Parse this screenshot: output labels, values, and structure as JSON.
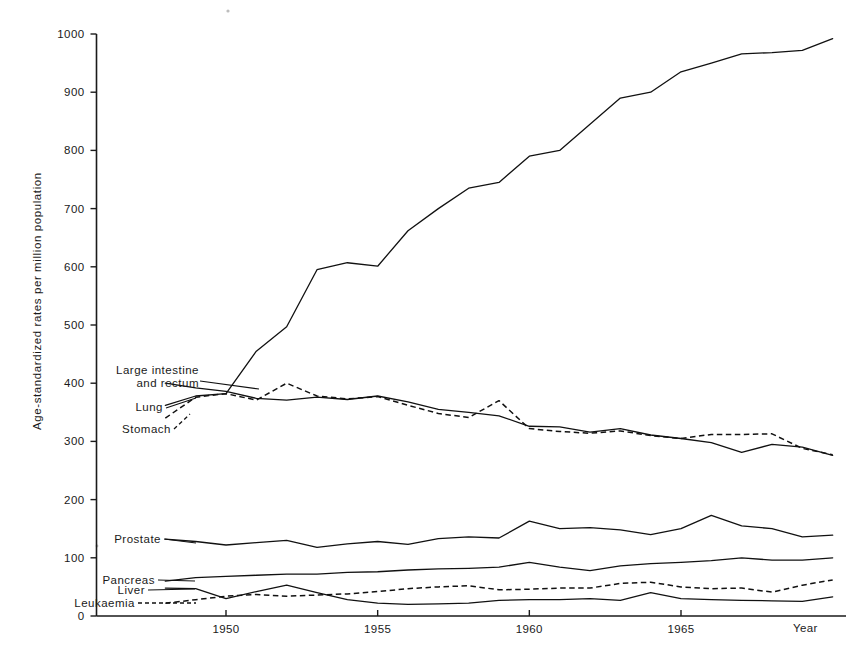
{
  "chart_data": {
    "type": "line",
    "title": "",
    "subtitle": "",
    "xlabel": "Year",
    "ylabel": "Age-standardized rates per million population",
    "xlim": [
      1947,
      1970.5
    ],
    "ylim": [
      0,
      1000
    ],
    "grid": false,
    "legend_position": "inline-left-labels",
    "y_ticks": [
      0,
      100,
      200,
      300,
      400,
      500,
      600,
      700,
      800,
      900,
      1000
    ],
    "y_tick_labels": [
      "0",
      "100",
      "200",
      "300",
      "400",
      "500",
      "600",
      "700",
      "800",
      "900",
      "1000"
    ],
    "x_ticks": [
      1950,
      1955,
      1960,
      1965
    ],
    "x_tick_labels": [
      "1950",
      "1955",
      "1960",
      "1965"
    ],
    "x": [
      1948,
      1949,
      1950,
      1951,
      1952,
      1953,
      1954,
      1955,
      1956,
      1957,
      1958,
      1959,
      1960,
      1961,
      1962,
      1963,
      1964,
      1965,
      1966,
      1967,
      1968,
      1969,
      1970
    ],
    "series": [
      {
        "name": "Lung",
        "style": "solid",
        "label": "Lung",
        "values": [
          362,
          378,
          382,
          455,
          497,
          595,
          607,
          601,
          662,
          700,
          735,
          745,
          790,
          800,
          845,
          890,
          900,
          935,
          950,
          966,
          968,
          972,
          992
        ]
      },
      {
        "name": "Large intestine and rectum",
        "style": "solid",
        "label": "Large  intestine\nand  rectum",
        "values": [
          400,
          392,
          386,
          374,
          371,
          376,
          372,
          378,
          368,
          355,
          350,
          344,
          326,
          325,
          316,
          322,
          311,
          305,
          298,
          281,
          295,
          290,
          276
        ]
      },
      {
        "name": "Stomach",
        "style": "dashed",
        "label": "Stomach",
        "values": [
          340,
          376,
          382,
          371,
          400,
          378,
          373,
          377,
          362,
          348,
          341,
          370,
          322,
          317,
          314,
          318,
          310,
          305,
          312,
          312,
          313,
          288,
          277
        ]
      },
      {
        "name": "Prostate",
        "style": "solid",
        "label": "Prostate",
        "values": [
          132,
          128,
          122,
          126,
          130,
          118,
          124,
          128,
          123,
          133,
          136,
          134,
          163,
          150,
          152,
          148,
          140,
          150,
          173,
          155,
          150,
          136,
          139
        ]
      },
      {
        "name": "Pancreas",
        "style": "solid",
        "label": "Pancreas",
        "values": [
          60,
          66,
          68,
          70,
          72,
          72,
          75,
          76,
          79,
          81,
          82,
          84,
          92,
          84,
          78,
          86,
          90,
          92,
          95,
          100,
          96,
          96,
          100
        ]
      },
      {
        "name": "Liver",
        "style": "solid",
        "label": "Liver",
        "values": [
          48,
          47,
          30,
          42,
          53,
          40,
          28,
          22,
          20,
          21,
          22,
          27,
          28,
          28,
          30,
          27,
          40,
          30,
          28,
          27,
          26,
          25,
          33
        ]
      },
      {
        "name": "Leukaemia",
        "style": "dashed",
        "label": "Leukaemia",
        "values": [
          22,
          28,
          34,
          37,
          34,
          36,
          38,
          42,
          47,
          50,
          52,
          45,
          46,
          48,
          48,
          56,
          58,
          50,
          47,
          48,
          41,
          53,
          62
        ]
      }
    ],
    "annotations": [
      {
        "name": "large-intestine-and-rectum-label",
        "text_line1": "Large  intestine",
        "text_line2": "and  rectum"
      },
      {
        "name": "lung-label",
        "text": "Lung"
      },
      {
        "name": "stomach-label",
        "text": "Stomach"
      },
      {
        "name": "prostate-label",
        "text": "Prostate"
      },
      {
        "name": "pancreas-label",
        "text": "Pancreas"
      },
      {
        "name": "liver-label",
        "text": "Liver"
      },
      {
        "name": "leukaemia-label",
        "text": "Leukaemia"
      }
    ],
    "colors": {
      "ink": "#111111",
      "background": "#ffffff"
    }
  },
  "axes": {
    "y_title": "Age-standardized rates per million population",
    "x_title": "Year"
  },
  "ticklabels": {
    "y": [
      "1000",
      "900",
      "800",
      "700",
      "600",
      "500",
      "400",
      "300",
      "200",
      "100",
      "0"
    ],
    "x": [
      "1950",
      "1955",
      "1960",
      "1965"
    ]
  },
  "labels": {
    "large_intestine_1": "Large  intestine",
    "large_intestine_2": "and  rectum",
    "lung": "Lung",
    "stomach": "Stomach",
    "prostate": "Prostate",
    "pancreas": "Pancreas",
    "liver": "Liver",
    "leukaemia": "Leukaemia",
    "year": "Year"
  }
}
